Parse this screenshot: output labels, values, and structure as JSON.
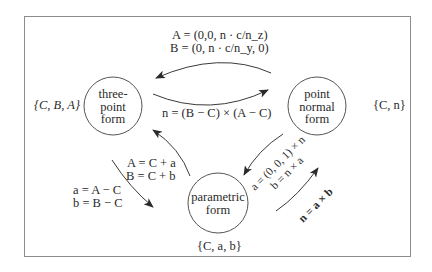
{
  "nodes": {
    "three_point": {
      "lines": [
        "three-",
        "point",
        "form"
      ],
      "set": "{C, B, A}"
    },
    "point_normal": {
      "lines": [
        "point",
        "normal",
        "form"
      ],
      "set": "{C, n}"
    },
    "parametric": {
      "lines": [
        "parametric",
        "form"
      ],
      "set": "{C, a, b}"
    }
  },
  "edges": {
    "normal_to_three": {
      "line1": "A = (0,0, n · c/n_z)",
      "line2": "B = (0, n · c/n_y, 0)"
    },
    "three_to_normal": {
      "label": "n = (B − C) × (A − C)"
    },
    "parametric_to_three": {
      "line1": "A = C + a",
      "line2": "B = C + b"
    },
    "three_to_parametric": {
      "line1": "a = A − C",
      "line2": "b = B − C"
    },
    "normal_to_parametric": {
      "line1": "a = (0, 0, 1) × n",
      "line2": "b = n × a"
    },
    "parametric_to_normal": {
      "label": "n = a × b"
    }
  },
  "colors": {
    "stroke": "#3a3a3a",
    "frame": "#8c8c8c",
    "text": "#2a2a2a"
  }
}
